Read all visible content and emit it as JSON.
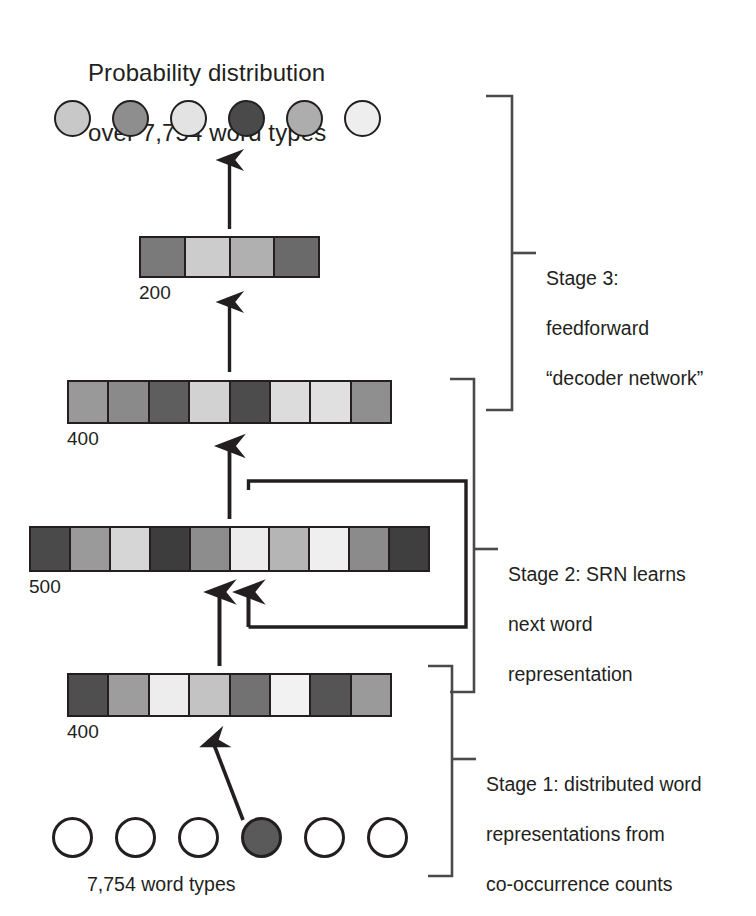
{
  "title": {
    "line1": "Probability distribution",
    "line2": "over 7,754 word types",
    "text": "Probability distribution\nover 7,754 word types"
  },
  "bottom_label": "7,754 word types",
  "stages": [
    {
      "id": "stage-3",
      "label": "Stage 3:\nfeedforward\n“decoder network”",
      "line1": "Stage 3:",
      "line2": "feedforward",
      "line3": "“decoder network”"
    },
    {
      "id": "stage-2",
      "label": "Stage 2: SRN learns\nnext word\nrepresentation",
      "line1": "Stage 2: SRN learns",
      "line2": "next word",
      "line3": "representation"
    },
    {
      "id": "stage-1",
      "label": "Stage 1: distributed word\nrepresentations from\nco-occurrence counts",
      "line1": "Stage 1: distributed word",
      "line2": "representations from",
      "line3": "co-occurrence counts"
    }
  ],
  "layers": [
    {
      "id": "output-units",
      "kind": "circles",
      "count": 6,
      "size_label": null,
      "fills": [
        "#c8c8c8",
        "#8e8e8e",
        "#e3e3e3",
        "#4a4a4a",
        "#adadad",
        "#eeeeee"
      ]
    },
    {
      "id": "hidden-200",
      "kind": "bar",
      "size_label": "200",
      "cells": 4,
      "fills": [
        "#7a7a7a",
        "#cccccc",
        "#b0b0b0",
        "#6a6a6a"
      ]
    },
    {
      "id": "hidden-400-upper",
      "kind": "bar",
      "size_label": "400",
      "cells": 8,
      "fills": [
        "#999999",
        "#8a8a8a",
        "#5e5e5e",
        "#d2d2d2",
        "#4c4c4c",
        "#dcdcdc",
        "#e0e0e0",
        "#8f8f8f"
      ]
    },
    {
      "id": "srn-500",
      "kind": "bar",
      "size_label": "500",
      "cells": 10,
      "fills": [
        "#4a4a4a",
        "#9a9a9a",
        "#d6d6d6",
        "#3d3d3d",
        "#8d8d8d",
        "#ececec",
        "#b5b5b5",
        "#efefef",
        "#8b8b8b",
        "#3f3f3f"
      ]
    },
    {
      "id": "input-400",
      "kind": "bar",
      "size_label": "400",
      "cells": 8,
      "fills": [
        "#4f4f4f",
        "#9d9d9d",
        "#ededed",
        "#c3c3c3",
        "#727272",
        "#f2f2f2",
        "#555555",
        "#9a9a9a"
      ]
    },
    {
      "id": "input-units",
      "kind": "circles",
      "count": 6,
      "size_label": null,
      "fills": [
        "#ffffff",
        "#ffffff",
        "#ffffff",
        "#5a5a5a",
        "#ffffff",
        "#ffffff"
      ],
      "active_index": 3
    }
  ],
  "colors": {
    "ink": "#231f20",
    "stroke": "#3a3a3a",
    "background": "#ffffff"
  },
  "arrows": [
    {
      "id": "arrow-200-to-output",
      "from": "hidden-200",
      "to": "output-units"
    },
    {
      "id": "arrow-400u-to-200",
      "from": "hidden-400-upper",
      "to": "hidden-200"
    },
    {
      "id": "arrow-500-to-400u",
      "from": "srn-500",
      "to": "hidden-400-upper"
    },
    {
      "id": "arrow-400i-to-500",
      "from": "input-400",
      "to": "srn-500"
    },
    {
      "id": "arrow-recurrent-into-500",
      "from": "srn-500",
      "to": "srn-500"
    },
    {
      "id": "arrow-input-unit-to-400",
      "from": "input-units",
      "to": "input-400"
    }
  ]
}
